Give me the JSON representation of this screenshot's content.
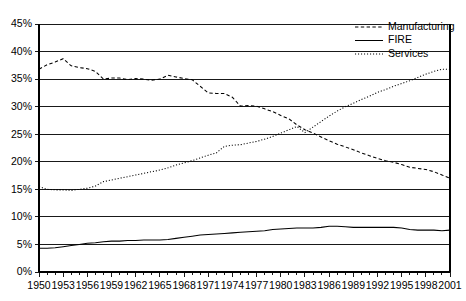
{
  "chart_data": {
    "type": "line",
    "title": "",
    "subtitle": "",
    "xlabel": "",
    "ylabel": "",
    "xlim": [
      1950,
      2001
    ],
    "ylim": [
      0,
      45
    ],
    "grid": true,
    "legend_position": "top-right",
    "y_ticks": [
      "0%",
      "5%",
      "10%",
      "15%",
      "20%",
      "25%",
      "30%",
      "35%",
      "40%",
      "45%"
    ],
    "y_tick_values": [
      0,
      5,
      10,
      15,
      20,
      25,
      30,
      35,
      40,
      45
    ],
    "x_tick_labels": [
      "1950",
      "1953",
      "1956",
      "1959",
      "1962",
      "1965",
      "1968",
      "1971",
      "1974",
      "1977",
      "1980",
      "1983",
      "1986",
      "1989",
      "1992",
      "1995",
      "1998",
      "2001"
    ],
    "x_tick_values": [
      1950,
      1953,
      1956,
      1959,
      1962,
      1965,
      1968,
      1971,
      1974,
      1977,
      1980,
      1983,
      1986,
      1989,
      1992,
      1995,
      1998,
      2001
    ],
    "x": [
      1950,
      1951,
      1952,
      1953,
      1954,
      1955,
      1956,
      1957,
      1958,
      1959,
      1960,
      1961,
      1962,
      1963,
      1964,
      1965,
      1966,
      1967,
      1968,
      1969,
      1970,
      1971,
      1972,
      1973,
      1974,
      1975,
      1976,
      1977,
      1978,
      1979,
      1980,
      1981,
      1982,
      1983,
      1984,
      1985,
      1986,
      1987,
      1988,
      1989,
      1990,
      1991,
      1992,
      1993,
      1994,
      1995,
      1996,
      1997,
      1998,
      1999,
      2000,
      2001
    ],
    "series": [
      {
        "name": "Manufacturing",
        "style": "dashed",
        "color": "#000000",
        "values": [
          36.8,
          37.6,
          38.1,
          38.7,
          37.4,
          37.1,
          36.9,
          36.4,
          35.0,
          35.2,
          35.2,
          34.9,
          35.1,
          35.0,
          34.8,
          35.0,
          35.7,
          35.4,
          35.1,
          34.9,
          33.7,
          32.5,
          32.4,
          32.4,
          31.7,
          30.1,
          30.2,
          30.1,
          29.6,
          29.1,
          28.4,
          27.8,
          26.7,
          25.8,
          25.2,
          24.5,
          23.8,
          23.2,
          22.7,
          22.2,
          21.6,
          21.1,
          20.6,
          20.2,
          19.9,
          19.5,
          19.0,
          18.8,
          18.6,
          18.2,
          17.6,
          17.0
        ]
      },
      {
        "name": "FIRE",
        "style": "solid",
        "color": "#000000",
        "values": [
          4.3,
          4.3,
          4.4,
          4.6,
          4.8,
          5.0,
          5.2,
          5.3,
          5.5,
          5.6,
          5.6,
          5.7,
          5.7,
          5.8,
          5.8,
          5.8,
          5.9,
          6.1,
          6.3,
          6.5,
          6.7,
          6.8,
          6.9,
          7.0,
          7.1,
          7.2,
          7.3,
          7.4,
          7.5,
          7.7,
          7.8,
          7.9,
          8.0,
          8.0,
          8.0,
          8.1,
          8.3,
          8.3,
          8.2,
          8.1,
          8.1,
          8.1,
          8.1,
          8.1,
          8.1,
          8.0,
          7.7,
          7.6,
          7.6,
          7.6,
          7.5,
          7.6
        ]
      },
      {
        "name": "Services",
        "style": "dotted",
        "color": "#000000",
        "values": [
          15.5,
          15.0,
          14.9,
          14.9,
          14.8,
          15.0,
          15.2,
          15.6,
          16.4,
          16.7,
          17.0,
          17.3,
          17.6,
          17.9,
          18.2,
          18.5,
          18.9,
          19.4,
          19.8,
          20.2,
          20.7,
          21.2,
          21.6,
          22.8,
          23.0,
          23.1,
          23.4,
          23.7,
          24.1,
          24.6,
          25.2,
          25.8,
          26.4,
          25.3,
          26.3,
          27.3,
          28.3,
          29.2,
          30.0,
          30.6,
          31.3,
          31.9,
          32.6,
          33.1,
          33.7,
          34.2,
          34.7,
          35.3,
          35.9,
          36.4,
          36.8,
          36.8
        ]
      }
    ]
  },
  "legend": {
    "items": [
      {
        "label": "Manufacturing",
        "style": "dashed"
      },
      {
        "label": "FIRE",
        "style": "solid"
      },
      {
        "label": "Services",
        "style": "dotted"
      }
    ]
  }
}
